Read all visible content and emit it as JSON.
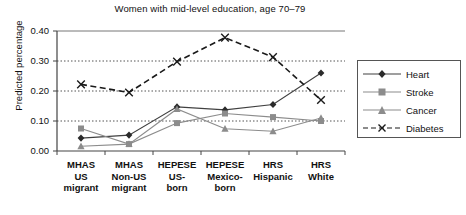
{
  "chart_data": {
    "type": "line",
    "title": "Women with mid-level education, age 70–79",
    "xlabel": "",
    "ylabel": "Predicted percentage",
    "ylim": [
      0.0,
      0.4
    ],
    "ytick_labels": [
      "0.00",
      "0.10",
      "0.20",
      "0.30",
      "0.40"
    ],
    "ytick_values": [
      0.0,
      0.1,
      0.2,
      0.3,
      0.4
    ],
    "grid": "horizontal-dotted",
    "legend_position": "right",
    "categories": [
      "MHAS\nUS\nmigrant",
      "MHAS\nNon-US\nmigrant",
      "HEPESE\nUS-\nborn",
      "HEPESE\nMexico-\nborn",
      "HRS\nHispanic",
      "HRS\nWhite"
    ],
    "series": [
      {
        "name": "Heart",
        "marker": "diamond",
        "line_style": "solid",
        "color": "#404040",
        "values": [
          0.043,
          0.053,
          0.147,
          0.137,
          0.155,
          0.26
        ]
      },
      {
        "name": "Stroke",
        "marker": "square",
        "line_style": "solid",
        "color": "#8c8c8c",
        "values": [
          0.075,
          0.023,
          0.093,
          0.125,
          0.113,
          0.1
        ]
      },
      {
        "name": "Cancer",
        "marker": "triangle",
        "line_style": "solid",
        "color": "#8c8c8c",
        "values": [
          0.016,
          0.023,
          0.14,
          0.074,
          0.066,
          0.11
        ]
      },
      {
        "name": "Diabetes",
        "marker": "x",
        "line_style": "dashed",
        "color": "#1a1a1a",
        "values": [
          0.222,
          0.195,
          0.298,
          0.378,
          0.313,
          0.17
        ]
      }
    ]
  },
  "legend": {
    "items": [
      {
        "label": "Heart"
      },
      {
        "label": "Stroke"
      },
      {
        "label": "Cancer"
      },
      {
        "label": "Diabetes"
      }
    ]
  }
}
